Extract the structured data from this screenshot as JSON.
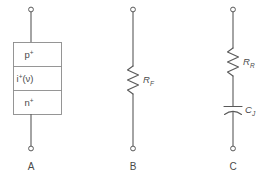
{
  "figure": {
    "title": "",
    "background_color": "#ffffff",
    "line_color": "#595959",
    "box_line_color": "#8a8a8a",
    "text_color": "#4a4a4a"
  },
  "panels": [
    {
      "id": "A",
      "caption": "A",
      "type": "layered-device-symbol",
      "layers": [
        {
          "base": "p",
          "superscript": "+",
          "full": "p+"
        },
        {
          "base": "i",
          "superscript": "+",
          "parenthetical": "(ν)",
          "full": "i+(ν)"
        },
        {
          "base": "n",
          "superscript": "+",
          "full": "n+"
        }
      ],
      "terminals": {
        "top": "open-circle",
        "bottom": "open-circle"
      }
    },
    {
      "id": "B",
      "caption": "B",
      "type": "resistor-symbol",
      "components": [
        {
          "symbol": "resistor",
          "base": "R",
          "subscript": "F",
          "full": "R_F"
        }
      ],
      "terminals": {
        "top": "open-circle",
        "bottom": "open-circle"
      }
    },
    {
      "id": "C",
      "caption": "C",
      "type": "series-rc-symbol",
      "components": [
        {
          "symbol": "resistor",
          "base": "R",
          "subscript": "R",
          "full": "R_R"
        },
        {
          "symbol": "capacitor",
          "base": "C",
          "subscript": "J",
          "full": "C_J"
        }
      ],
      "terminals": {
        "top": "open-circle",
        "bottom": "open-circle"
      }
    }
  ]
}
